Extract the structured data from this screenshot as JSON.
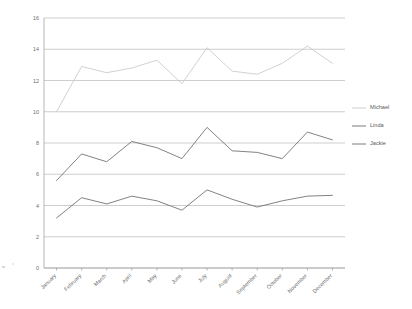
{
  "chart_data": {
    "type": "line",
    "title": "",
    "subtitle": "",
    "xlabel": "",
    "ylabel": "",
    "categories": [
      "January",
      "February",
      "March",
      "April",
      "May",
      "June",
      "July",
      "August",
      "September",
      "October",
      "November",
      "December"
    ],
    "series": [
      {
        "name": "Michael",
        "color": "#c9c9c9",
        "values": [
          10.0,
          12.9,
          12.5,
          12.8,
          13.3,
          11.8,
          14.1,
          12.6,
          12.4,
          13.1,
          14.2,
          13.1
        ]
      },
      {
        "name": "Linda",
        "color": "#6b6b6b",
        "values": [
          5.6,
          7.3,
          6.8,
          8.1,
          7.7,
          7.0,
          9.0,
          7.5,
          7.4,
          7.0,
          8.7,
          8.2
        ]
      },
      {
        "name": "Jackie",
        "color": "#6b6b6b",
        "values": [
          3.2,
          4.5,
          4.1,
          4.6,
          4.3,
          3.7,
          5.0,
          4.4,
          3.9,
          4.3,
          4.6,
          4.65
        ]
      }
    ],
    "ylim": [
      0,
      16
    ],
    "yticks": [
      0,
      2,
      4,
      6,
      8,
      10,
      12,
      14,
      16
    ],
    "ytick_labels": [
      "0",
      "2",
      "4",
      "6",
      "8",
      "10",
      "12",
      "14",
      "16"
    ],
    "grid": true,
    "grid_axis": "y",
    "legend": {
      "position": "right",
      "entries": [
        {
          "label": "Michael",
          "color": "#c9c9c9"
        },
        {
          "label": "Linda",
          "color": "#6b6b6b"
        },
        {
          "label": "Jackie",
          "color": "#6b6b6b"
        }
      ]
    },
    "markers": false,
    "xtick_rotation": -45
  },
  "colors": {
    "background": "#ffffff",
    "gridline": "#b9b9b9",
    "axis": "#9a9a9a",
    "tick_text": "#6d6d6d",
    "legend_text": "#5a5a5a"
  }
}
